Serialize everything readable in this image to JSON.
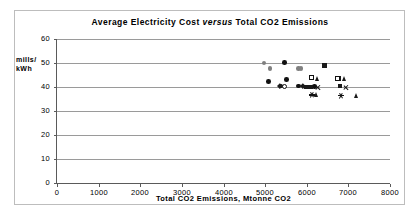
{
  "chart_data": {
    "type": "scatter",
    "title": "Average Electricity Cost versus Total CO2 Emissions",
    "title_parts": {
      "before": "Average Electricity Cost ",
      "italic": "versus",
      "after": " Total CO2 Emissions"
    },
    "xlabel": "Total CO2 Emissions, Mtonne CO2",
    "ylabel": "mills/\nkWh",
    "ylabel_line1": "mills/",
    "ylabel_line2": "kWh",
    "xlim": [
      0,
      8000
    ],
    "ylim": [
      0,
      60
    ],
    "xticks": [
      0,
      1000,
      2000,
      3000,
      4000,
      5000,
      6000,
      7000,
      8000
    ],
    "yticks": [
      0,
      10,
      20,
      30,
      40,
      50,
      60
    ],
    "grid": "horizontal",
    "legend": "none",
    "series": [
      {
        "name": "gray-circles",
        "marker": "circle",
        "color": "#808080",
        "points": [
          {
            "x": 4970,
            "y": 50.0
          },
          {
            "x": 5120,
            "y": 47.6
          },
          {
            "x": 5800,
            "y": 47.8
          },
          {
            "x": 5860,
            "y": 47.8
          }
        ]
      },
      {
        "name": "black-circles",
        "marker": "circle",
        "color": "#111111",
        "points": [
          {
            "x": 5080,
            "y": 42.3
          },
          {
            "x": 5460,
            "y": 50.3
          },
          {
            "x": 5520,
            "y": 43.1
          },
          {
            "x": 5380,
            "y": 40.4
          },
          {
            "x": 5800,
            "y": 40.4
          },
          {
            "x": 6180,
            "y": 40.1
          }
        ]
      },
      {
        "name": "open-circles",
        "marker": "open-circle",
        "color": "#111111",
        "points": [
          {
            "x": 5450,
            "y": 40.3
          }
        ]
      },
      {
        "name": "black-squares",
        "marker": "square",
        "color": "#1a1a1a",
        "points": [
          {
            "x": 6000,
            "y": 40.0
          },
          {
            "x": 6420,
            "y": 48.9
          },
          {
            "x": 6100,
            "y": 40.0
          },
          {
            "x": 6800,
            "y": 40.4
          },
          {
            "x": 6760,
            "y": 43.6
          }
        ]
      },
      {
        "name": "open-squares",
        "marker": "open-square",
        "color": "#111111",
        "points": [
          {
            "x": 6110,
            "y": 43.9
          },
          {
            "x": 6740,
            "y": 43.8
          }
        ]
      },
      {
        "name": "triangles",
        "marker": "triangle",
        "color": "#1a1a1a",
        "points": [
          {
            "x": 6260,
            "y": 43.7
          },
          {
            "x": 6900,
            "y": 43.6
          },
          {
            "x": 6250,
            "y": 36.7
          },
          {
            "x": 7200,
            "y": 36.3
          }
        ]
      },
      {
        "name": "x-crosses",
        "marker": "x",
        "color": "#111111",
        "points": [
          {
            "x": 6260,
            "y": 39.8
          },
          {
            "x": 6930,
            "y": 39.9
          }
        ]
      },
      {
        "name": "diamonds",
        "marker": "diamond",
        "color": "#1a1a1a",
        "points": [
          {
            "x": 5360,
            "y": 40.4
          },
          {
            "x": 5900,
            "y": 40.4
          }
        ]
      },
      {
        "name": "stars",
        "marker": "star",
        "color": "#111111",
        "points": [
          {
            "x": 6120,
            "y": 36.7
          },
          {
            "x": 6820,
            "y": 36.6
          }
        ]
      }
    ]
  }
}
